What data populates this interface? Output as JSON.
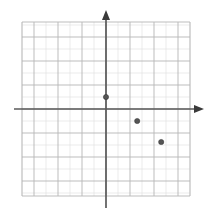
{
  "figure": {
    "kind": "coordinate-plane",
    "background_color": "#ffffff",
    "grid_color_minor": "#e3e3e3",
    "grid_color_major": "#b6b6b6",
    "axis_color": "#5a5a5a",
    "point_color": "#555555"
  },
  "chart_data": {
    "type": "scatter",
    "title": "",
    "subtitle": "",
    "xlabel": "",
    "ylabel": "",
    "xlim": [
      -7,
      7
    ],
    "ylim": [
      -7.25,
      7.25
    ],
    "grid": true,
    "legend": null,
    "legend_position": "none",
    "axis_arrows": {
      "x_positive": true,
      "x_negative": false,
      "y_positive": true,
      "y_negative": false
    },
    "xticks": [
      -7,
      -6,
      -5,
      -4,
      -3,
      -2,
      -1,
      0,
      1,
      2,
      3,
      4,
      5,
      6,
      7
    ],
    "yticks": [
      -7,
      -6,
      -5,
      -4,
      -3,
      -2,
      -1,
      0,
      1,
      2,
      3,
      4,
      5,
      6,
      7
    ],
    "xtick_labels": [],
    "ytick_labels": [],
    "series": [
      {
        "name": "points",
        "points": [
          {
            "label": "A",
            "x": 0,
            "y": 1
          },
          {
            "label": "B",
            "x": 2.6,
            "y": -1
          },
          {
            "label": "C",
            "x": 4.6,
            "y": -2.75
          }
        ]
      }
    ],
    "annotations": []
  }
}
